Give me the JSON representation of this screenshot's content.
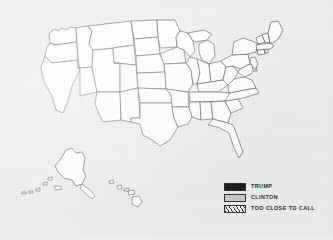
{
  "figure": {
    "kind": "us-electoral-map",
    "background_color": "#eeeeee",
    "state_fill": "#ffffff",
    "state_border_color": "#3a3a3a",
    "states_filled": false,
    "includes_alaska": true,
    "includes_hawaii": true
  },
  "legend": {
    "items": [
      {
        "label": "TRUMP",
        "swatch": "solid-black",
        "color": "#181818"
      },
      {
        "label": "CLINTON",
        "swatch": "solid-gray",
        "color": "#c9c9c9"
      },
      {
        "label": "TOO CLOSE TO CALL",
        "swatch": "diagonal-hatch",
        "color": "#ffffff"
      }
    ]
  }
}
